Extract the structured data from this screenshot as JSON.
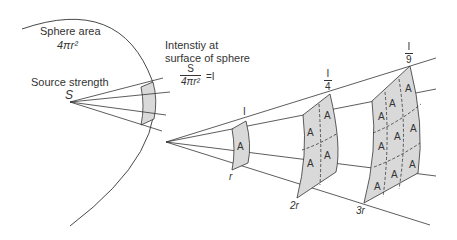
{
  "labels": {
    "sphere_area_title": "Sphere area",
    "sphere_area_formula": "4πr²",
    "source_strength_title": "Source strength",
    "source_symbol": "S",
    "intensity_line1": "Intenstiy at",
    "intensity_line2": "surface of sphere",
    "intensity_numerator": "S",
    "intensity_denominator": "4πr²",
    "intensity_equals": "=I"
  },
  "distances": {
    "d1": "r",
    "d2": "2r",
    "d3": "3r"
  },
  "intensities": {
    "i1": "I",
    "i2_num": "I",
    "i2_den": "4",
    "i3_num": "I",
    "i3_den": "9"
  },
  "patch_label": "A",
  "colors": {
    "line": "#333333",
    "patch_fill": "#d9d9d9",
    "background": "#ffffff"
  }
}
